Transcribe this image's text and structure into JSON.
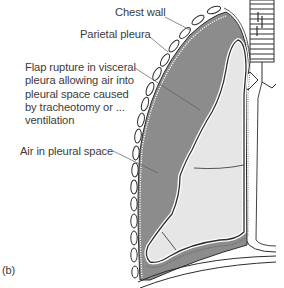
{
  "figure": {
    "panel_label": "(b)",
    "labels": {
      "chest_wall": "Chest wall",
      "parietal_pleura": "Parietal pleura",
      "flap_rupture": "Flap rupture in visceral\npleura allowing air into\npleural space caused\nby tracheotomy or ...\nventilation",
      "air_in_pleural_space": "Air in pleural space"
    },
    "colors": {
      "pleural_space": "#8c8c8c",
      "lung": "#e6e6e6",
      "outline": "#2e2e2e",
      "rib": "#ffffff",
      "text": "#3c3c3c"
    }
  }
}
